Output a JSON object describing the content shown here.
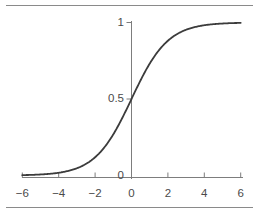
{
  "figure": {
    "width": 259,
    "height": 213,
    "background": "#ffffff",
    "rule_color": "#8a8a8a"
  },
  "chart_data": {
    "type": "line",
    "title": "",
    "subtitle": "",
    "xlabel": "",
    "ylabel": "",
    "function": "logistic",
    "formula": "y = 1 / (1 + exp(-x))",
    "xlim": [
      -6,
      6
    ],
    "ylim": [
      0,
      1
    ],
    "grid": false,
    "legend": null,
    "legend_position": "none",
    "axis_style": "spine-cross",
    "series": [
      {
        "name": "logistic",
        "color": "#3c3c3c",
        "line_width": 1.8,
        "x": [
          -6,
          -5.5,
          -5,
          -4.5,
          -4,
          -3.5,
          -3,
          -2.5,
          -2,
          -1.5,
          -1,
          -0.5,
          0,
          0.5,
          1,
          1.5,
          2,
          2.5,
          3,
          3.5,
          4,
          4.5,
          5,
          5.5,
          6
        ],
        "y": [
          0.002,
          0.004,
          0.007,
          0.011,
          0.018,
          0.029,
          0.047,
          0.076,
          0.119,
          0.182,
          0.269,
          0.378,
          0.5,
          0.622,
          0.731,
          0.818,
          0.881,
          0.924,
          0.953,
          0.971,
          0.982,
          0.989,
          0.993,
          0.996,
          0.998
        ]
      }
    ],
    "x_ticks": [
      {
        "value": -6,
        "label": "−6"
      },
      {
        "value": -4,
        "label": "−4"
      },
      {
        "value": -2,
        "label": "−2"
      },
      {
        "value": 0,
        "label": "0"
      },
      {
        "value": 2,
        "label": "2"
      },
      {
        "value": 4,
        "label": "4"
      },
      {
        "value": 6,
        "label": "6"
      }
    ],
    "y_ticks": [
      {
        "value": 1,
        "label": "1"
      },
      {
        "value": 0.5,
        "label": "0.5"
      },
      {
        "value": 0,
        "label": "0"
      }
    ]
  }
}
